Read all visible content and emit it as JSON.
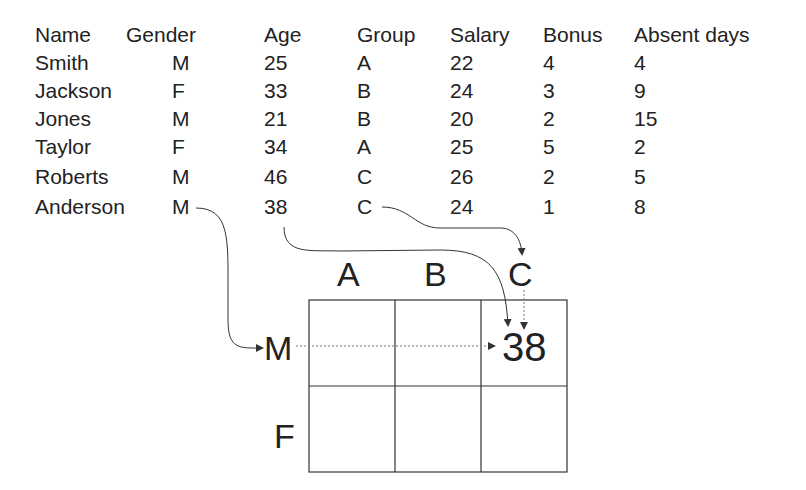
{
  "table": {
    "headers": [
      "Name",
      "Gender",
      "Age",
      "Group",
      "Salary",
      "Bonus",
      "Absent days"
    ],
    "rows": [
      [
        "Smith",
        "M",
        "25",
        "A",
        "22",
        "4",
        "4"
      ],
      [
        "Jackson",
        "F",
        "33",
        "B",
        "24",
        "3",
        "9"
      ],
      [
        "Jones",
        "M",
        "21",
        "B",
        "20",
        "2",
        "15"
      ],
      [
        "Taylor",
        "F",
        "34",
        "A",
        "25",
        "5",
        "2"
      ],
      [
        "Roberts",
        "M",
        "46",
        "C",
        "26",
        "2",
        "5"
      ],
      [
        "Anderson",
        "M",
        "38",
        "C",
        "24",
        "1",
        "8"
      ]
    ]
  },
  "grid": {
    "columns": [
      "A",
      "B",
      "C"
    ],
    "rows": [
      "M",
      "F"
    ],
    "highlight_value": "38"
  }
}
